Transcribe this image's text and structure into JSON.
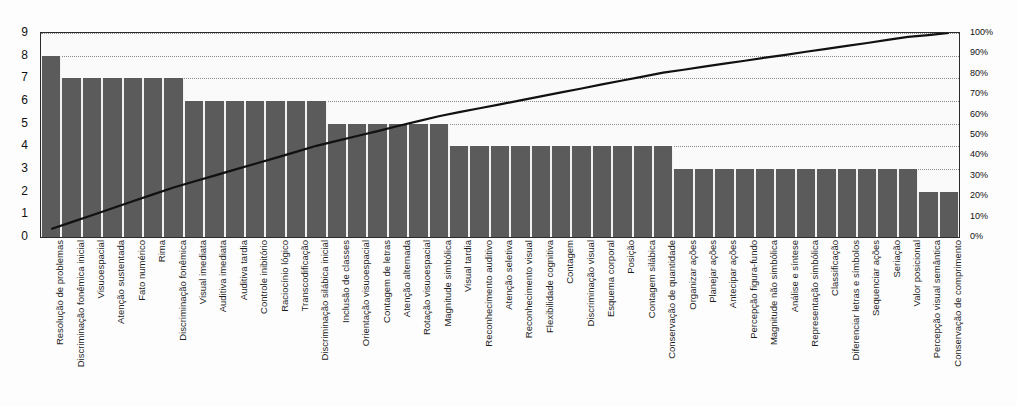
{
  "chart_data": {
    "type": "bar",
    "title": "",
    "subtitle": "",
    "xlabel": "",
    "ylabel": "",
    "grid": true,
    "legend_position": "none",
    "ylim": [
      0,
      9
    ],
    "y_ticks": [
      0,
      1,
      2,
      3,
      4,
      5,
      6,
      7,
      8,
      9
    ],
    "secondary_axis": {
      "label": "",
      "ylim": [
        0,
        100
      ],
      "ticks": [
        "0%",
        "10%",
        "20%",
        "30%",
        "40%",
        "50%",
        "60%",
        "70%",
        "80%",
        "90%",
        "100%"
      ],
      "tick_values": [
        0,
        10,
        20,
        30,
        40,
        50,
        60,
        70,
        80,
        90,
        100
      ]
    },
    "categories": [
      "Resolução de problemas",
      "Discriminação fonêmica inicial",
      "Visuoespacial",
      "Atenção sustentada",
      "Fato numérico",
      "Rima",
      "Discriminação fonêmica",
      "Visual imediata",
      "Auditiva imediata",
      "Auditiva tardia",
      "Controle inibitório",
      "Raciocínio lógico",
      "Transcodificação",
      "Discriminação silábica inicial",
      "Inclusão de classes",
      "Orientação visuoespacial",
      "Contagem de letras",
      "Atenção alternada",
      "Rotação visuoespacial",
      "Magnitude simbólica",
      "Visual tardia",
      "Reconhecimento auditivo",
      "Atenção seletiva",
      "Reconhecimento visual",
      "Flexibilidade cognitiva",
      "Contagem",
      "Discriminação visual",
      "Esquema corporal",
      "Posição",
      "Contagem silábica",
      "Conservação de quantidade",
      "Organizar ações",
      "Planejar ações",
      "Antecipar ações",
      "Percepção figura-fundo",
      "Magnitude não simbólica",
      "Análise e síntese",
      "Representação simbólica",
      "Classificação",
      "Diferenciar letras e símbolos",
      "Sequenciar ações",
      "Seriação",
      "Valor posicional",
      "Percepção visual semântica",
      "Conservação de comprimento"
    ],
    "values": [
      8,
      7,
      7,
      7,
      7,
      7,
      7,
      6,
      6,
      6,
      6,
      6,
      6,
      6,
      5,
      5,
      5,
      5,
      5,
      5,
      4,
      4,
      4,
      4,
      4,
      4,
      4,
      4,
      4,
      4,
      4,
      3,
      3,
      3,
      3,
      3,
      3,
      3,
      3,
      3,
      3,
      3,
      3,
      2,
      2
    ],
    "series": [
      {
        "name": "Frequência",
        "type": "bar",
        "axis": "left",
        "color": "#5b5b5b",
        "values": [
          8,
          7,
          7,
          7,
          7,
          7,
          7,
          6,
          6,
          6,
          6,
          6,
          6,
          6,
          5,
          5,
          5,
          5,
          5,
          5,
          4,
          4,
          4,
          4,
          4,
          4,
          4,
          4,
          4,
          4,
          4,
          3,
          3,
          3,
          3,
          3,
          3,
          3,
          3,
          3,
          3,
          3,
          3,
          2,
          2
        ]
      },
      {
        "name": "Percentual acumulado",
        "type": "line",
        "axis": "right",
        "color": "#111111",
        "values": [
          3.9,
          7.3,
          10.7,
          14.1,
          17.5,
          20.9,
          24.3,
          27.2,
          30.1,
          33.0,
          35.9,
          38.8,
          41.7,
          44.7,
          47.1,
          49.5,
          51.9,
          54.4,
          56.8,
          59.2,
          61.2,
          63.1,
          65.0,
          67.0,
          68.9,
          70.9,
          72.8,
          74.8,
          76.7,
          78.6,
          80.6,
          82.0,
          83.5,
          85.0,
          86.4,
          87.9,
          89.3,
          90.8,
          92.2,
          93.7,
          95.1,
          96.6,
          98.1,
          99.0,
          100.0
        ]
      }
    ]
  },
  "colors": {
    "bar": "#5b5b5b",
    "line": "#111111",
    "grid": "#8a8a8a",
    "frame": "#2b2b2b",
    "plot_background": "#fafafa",
    "page_background": "#ffffff"
  }
}
